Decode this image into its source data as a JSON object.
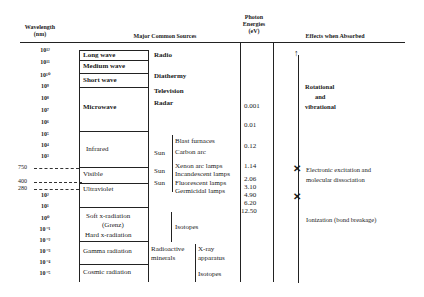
{
  "headers": {
    "wavelength": "Wavelength",
    "wavelength_unit": "(nm)",
    "sources": "Major Common Sources",
    "photon_1": "Photon",
    "photon_2": "Energies",
    "photon_3": "(eV)",
    "effects": "Effects when Absorbed"
  },
  "wavelengths": [
    "10¹²",
    "10¹¹",
    "10¹⁰",
    "10⁹",
    "10⁸",
    "10⁷",
    "10⁶",
    "10⁵",
    "10⁴",
    "10³",
    "10²",
    "10¹",
    "10⁰",
    "10⁻¹",
    "10⁻²",
    "10⁻³",
    "10⁻⁴",
    "10⁻⁵"
  ],
  "markers": [
    "750",
    "400",
    "280"
  ],
  "bands": {
    "long_wave": "Long wave",
    "medium_wave": "Medium wave",
    "short_wave": "Short wave",
    "microwave": "Microwave",
    "infrared": "Infrared",
    "visible": "Visible",
    "ultraviolet": "Ultraviolet",
    "soft_x": "Soft  x-radiation",
    "grenz": "(Grenz)",
    "hard_x": "Hard  x-radiation",
    "gamma": "Gamma radiation",
    "cosmic": "Cosmic radiation"
  },
  "sources": {
    "radio": "Radio",
    "diathermy": "Diathermy",
    "television": "Television",
    "radar": "Radar",
    "sun1": "Sun",
    "sun2": "Sun",
    "sun3": "Sun",
    "blast": "Blast furnaces",
    "carbon": "Carbon arc",
    "xenon": "Xenon arc lamps",
    "incandescent": "Incandescent lamps",
    "fluorescent": "Fluorescent lamps",
    "germicidal": "Germicidal lamps",
    "isotopes1": "Isotopes",
    "radioactive": "Radioactive",
    "minerals": "minerals",
    "xray": "X-ray",
    "apparatus": "apparatus",
    "isotopes2": "Isotopes"
  },
  "energies": [
    "0.001",
    "0.01",
    "0.12",
    "1.14",
    "2.06",
    "3.10",
    "4.90",
    "6.20",
    "12.50"
  ],
  "effects": {
    "rot1": "Rotational",
    "rot2": "and",
    "rot3": "vibrational",
    "elec1": "Electronic excitation and",
    "elec2": "molecular dissociation",
    "ion": "Ionization (bond breakage)"
  }
}
